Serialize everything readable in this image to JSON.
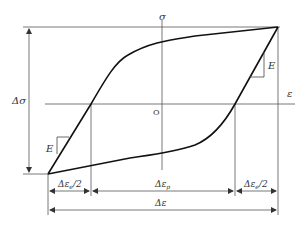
{
  "diagram": {
    "axes": {
      "x_label": "ε",
      "y_label": "σ",
      "origin_label": "O"
    },
    "labels": {
      "stress_range": "Δσ",
      "elastic_modulus_left": "E",
      "elastic_modulus_right": "E",
      "elastic_strain_half_left": "Δε",
      "elastic_strain_half_left_sub": "e",
      "elastic_strain_half_left_suffix": "/2",
      "plastic_strain": "Δε",
      "plastic_strain_sub": "p",
      "elastic_strain_half_right": "Δε",
      "elastic_strain_half_right_sub": "e",
      "elastic_strain_half_right_suffix": "/2",
      "total_strain": "Δε"
    },
    "colors": {
      "curve": "#111111",
      "lines": "#555555",
      "background": "#ffffff"
    }
  }
}
